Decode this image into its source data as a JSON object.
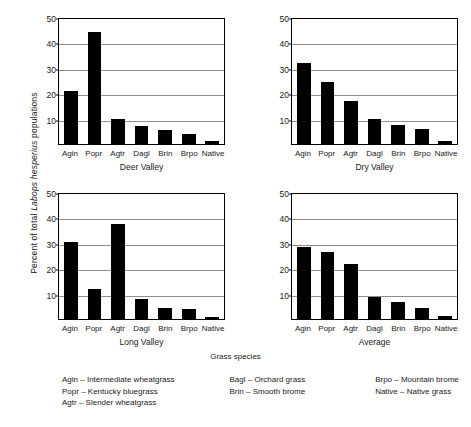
{
  "chart_data": {
    "type": "bar",
    "title": "",
    "ylabel": "Percent of total Labops hesperius populations",
    "ylabel_plain": "Percent of total ",
    "ylabel_italic": "Labops hesperius",
    "ylabel_tail": " populations",
    "xlabel": "Grass species",
    "categories": [
      "Agin",
      "Popr",
      "Agtr",
      "Dagl",
      "Brin",
      "Brpo",
      "Native"
    ],
    "ylim": [
      0,
      50
    ],
    "yticks": [
      10,
      20,
      30,
      40,
      50
    ],
    "grid": true,
    "legend_position": "below",
    "panels": [
      {
        "title": "Deer Valley",
        "values": [
          21,
          44,
          10,
          7,
          5.5,
          4,
          1
        ]
      },
      {
        "title": "Dry Valley",
        "values": [
          31.8,
          24.3,
          17,
          10,
          7.3,
          6,
          1.3
        ]
      },
      {
        "title": "Long Valley",
        "values": [
          30.3,
          12,
          37.5,
          8,
          4.3,
          3.8,
          0.8
        ]
      },
      {
        "title": "Average",
        "values": [
          28.2,
          26.5,
          21.5,
          8.5,
          6.8,
          4.5,
          1
        ]
      }
    ],
    "legend": [
      {
        "code": "Agin",
        "dash": "–",
        "name": "Intermediate wheatgrass"
      },
      {
        "code": "Popr",
        "dash": "–",
        "name": "Kentucky bluegrass"
      },
      {
        "code": "Agtr",
        "dash": "–",
        "name": "Slender wheatgrass"
      },
      {
        "code": "Bagl",
        "dash": "–",
        "name": "Orchard grass"
      },
      {
        "code": "Brin",
        "dash": "–",
        "name": "Smooth brome"
      },
      {
        "code": "Brpo",
        "dash": "–",
        "name": "Mountain brome"
      },
      {
        "code": "Native",
        "dash": "–",
        "name": "Native grass"
      }
    ],
    "legend_columns": [
      [
        0,
        1,
        2
      ],
      [
        3,
        4
      ],
      [
        5,
        6
      ]
    ],
    "colors": {
      "bar": "#000000",
      "grid": "#8e8e8e",
      "axis": "#000000",
      "background": "#ffffff",
      "text": "#1a1a1a"
    }
  }
}
